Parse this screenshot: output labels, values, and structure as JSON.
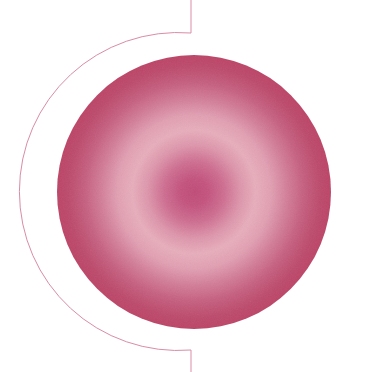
{
  "canvas": {
    "width": 366,
    "height": 372,
    "background_color": "#ffffff",
    "title": "Abstract Radial Circle Graphic"
  },
  "artwork": {
    "name": "radial-gradient-disc-with-arc",
    "description": "Soft grainy pink radial-gradient disc overlapped by a thin rose arc and two short vertical rules"
  },
  "disc": {
    "name": "gradient-disc",
    "center_x": 194,
    "center_y": 192,
    "radius": 137,
    "gradient_type": "radial",
    "gradient_stops": [
      {
        "offset": "0%",
        "color": "#c04c78"
      },
      {
        "offset": "10%",
        "color": "#c4537e"
      },
      {
        "offset": "22%",
        "color": "#cf6e91"
      },
      {
        "offset": "34%",
        "color": "#de96ac"
      },
      {
        "offset": "45%",
        "color": "#e8aebc"
      },
      {
        "offset": "56%",
        "color": "#e2a0b3"
      },
      {
        "offset": "68%",
        "color": "#d37e99"
      },
      {
        "offset": "80%",
        "color": "#c65f80"
      },
      {
        "offset": "92%",
        "color": "#bd4a6c"
      },
      {
        "offset": "100%",
        "color": "#bd4467"
      }
    ],
    "grain_opacity": 0.5
  },
  "arc": {
    "name": "thin-rose-arc",
    "stroke_color": "#d98da5",
    "stroke_width": 1,
    "start_x": 191,
    "start_y": 33,
    "end_x": 191,
    "end_y": 350,
    "radius_x": 159,
    "radius_y": 159,
    "sweep": "counter-clockwise-left",
    "leftmost_x": 33
  },
  "rules": [
    {
      "name": "top-vertical-rule",
      "x": 191,
      "y_start": 0,
      "y_end": 33,
      "stroke_color": "#d98da5",
      "stroke_width": 1
    },
    {
      "name": "bottom-vertical-rule",
      "x": 191,
      "y_start": 350,
      "y_end": 372,
      "stroke_color": "#d98da5",
      "stroke_width": 1
    }
  ],
  "palette": {
    "core": "#c4537e",
    "halo": "#e8aebc",
    "rim": "#bd4467",
    "line": "#d98da5",
    "background": "#ffffff"
  }
}
